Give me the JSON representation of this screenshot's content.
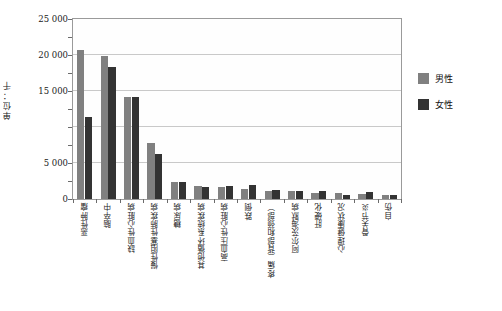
{
  "chart_data": {
    "type": "bar",
    "title": "",
    "xlabel": "",
    "ylabel": "单位：千",
    "ylim": [
      0,
      25000
    ],
    "ytick_labels": [
      "25 000",
      "20 000",
      "15 000",
      "",
      "5 000",
      "0"
    ],
    "ytick_values": [
      25000,
      20000,
      15000,
      10000,
      5000,
      0
    ],
    "gridlines": true,
    "legend_position": "right",
    "categories": [
      "恶性肿瘤",
      "脑卒中",
      "缺血性心脏病",
      "慢性阻塞性肺疾病",
      "糖尿病",
      "其他循环系统疾病",
      "高血压性心脏病",
      "跌倒",
      "疼痛（背部和颈部）",
      "阿尔茨海默病",
      "肝硬化",
      "心理健康状况",
      "骨关节炎",
      "自伤"
    ],
    "series": [
      {
        "name": "男性",
        "color": "#808080",
        "values": [
          20700,
          19800,
          14200,
          7800,
          2300,
          1800,
          1600,
          1450,
          1150,
          1100,
          800,
          800,
          700,
          600
        ]
      },
      {
        "name": "女性",
        "color": "#333333",
        "values": [
          11400,
          18400,
          14200,
          6300,
          2400,
          1700,
          1750,
          1900,
          1200,
          1150,
          1050,
          500,
          1000,
          600
        ]
      }
    ]
  },
  "legend": {
    "items": [
      {
        "label": "男性",
        "color": "#808080"
      },
      {
        "label": "女性",
        "color": "#333333"
      }
    ]
  }
}
